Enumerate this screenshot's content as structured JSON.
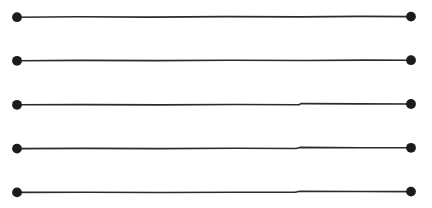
{
  "figure": {
    "background_color": "#ffffff",
    "canvas": {
      "width": 432,
      "height": 208
    },
    "style": {
      "line_color": "#2b2b2b",
      "line_width": 1.6,
      "dot_color": "#1c1c1c",
      "dot_radius": 4.8,
      "rendering": "hand-drawn scanned ink, slight wobble"
    }
  },
  "chart_data": {
    "type": "line",
    "xlabel": "",
    "ylabel": "",
    "xlim": [
      0,
      432
    ],
    "ylim": [
      0,
      208
    ],
    "grid": false,
    "legend": "none",
    "annotations": [],
    "series": [
      {
        "name": "segment-1",
        "marker": "filled-circle",
        "x": [
          17,
          411
        ],
        "y": [
          17,
          16.5
        ],
        "length_px": 394,
        "path": "M 17 17.2 L 78 16.8 L 150 17.1 L 225 16.6 L 300 16.9 L 360 16.4 L 411 16.6"
      },
      {
        "name": "segment-2",
        "marker": "filled-circle",
        "x": [
          17,
          411
        ],
        "y": [
          60.5,
          60.2
        ],
        "length_px": 394,
        "path": "M 17 60.8 L 80 60.4 L 155 60.6 L 230 60.2 L 305 60.5 L 365 60.1 L 411 60.2"
      },
      {
        "name": "segment-3",
        "marker": "filled-circle",
        "x": [
          17,
          411
        ],
        "y": [
          104.5,
          104.0
        ],
        "length_px": 394,
        "path": "M 17 104.8 L 85 104.6 L 160 104.9 L 235 104.5 L 299 104.7 L 301 103.6 L 360 103.9 L 411 104.0"
      },
      {
        "name": "segment-4",
        "marker": "filled-circle",
        "x": [
          17,
          411
        ],
        "y": [
          148.3,
          147.8
        ],
        "length_px": 394,
        "path": "M 17 148.6 L 85 148.4 L 160 148.6 L 235 148.3 L 296 148.5 L 300 147.4 L 360 147.7 L 411 147.8"
      },
      {
        "name": "segment-5",
        "marker": "filled-circle",
        "x": [
          17,
          411
        ],
        "y": [
          192.2,
          191.6
        ],
        "length_px": 394,
        "path": "M 17 192.4 L 85 192.3 L 160 192.5 L 235 192.2 L 295 192.3 L 300 191.3 L 360 191.5 L 411 191.6"
      }
    ],
    "endpoints": [
      {
        "name": "segment-1-left",
        "cx": 17,
        "cy": 17.2,
        "r": 4.9
      },
      {
        "name": "segment-1-right",
        "cx": 411,
        "cy": 16.6,
        "r": 4.9
      },
      {
        "name": "segment-2-left",
        "cx": 17,
        "cy": 60.8,
        "r": 4.9
      },
      {
        "name": "segment-2-right",
        "cx": 411,
        "cy": 60.2,
        "r": 4.9
      },
      {
        "name": "segment-3-left",
        "cx": 17,
        "cy": 104.8,
        "r": 4.9
      },
      {
        "name": "segment-3-right",
        "cx": 411,
        "cy": 104.0,
        "r": 4.9
      },
      {
        "name": "segment-4-left",
        "cx": 17,
        "cy": 148.6,
        "r": 4.9
      },
      {
        "name": "segment-4-right",
        "cx": 411,
        "cy": 147.8,
        "r": 4.9
      },
      {
        "name": "segment-5-left",
        "cx": 17,
        "cy": 192.4,
        "r": 4.9
      },
      {
        "name": "segment-5-right",
        "cx": 411,
        "cy": 191.6,
        "r": 4.9
      }
    ]
  }
}
